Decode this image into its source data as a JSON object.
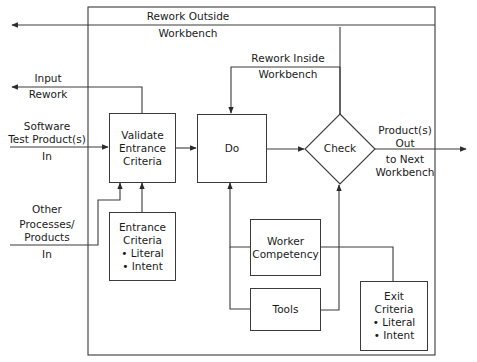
{
  "diagram": {
    "type": "workbench-process-flow",
    "nodes": {
      "validate": {
        "label": "Validate Entrance Criteria",
        "lines": [
          "Validate",
          "Entrance",
          "Criteria"
        ]
      },
      "do": {
        "label": "Do"
      },
      "check": {
        "label": "Check",
        "shape": "diamond"
      },
      "entrance_criteria": {
        "title_lines": [
          "Entrance",
          "Criteria"
        ],
        "bullets": [
          "• Literal",
          "• Intent"
        ]
      },
      "worker_competency": {
        "lines": [
          "Worker",
          "Competency"
        ]
      },
      "tools": {
        "label": "Tools"
      },
      "exit_criteria": {
        "title_lines": [
          "Exit",
          "Criteria"
        ],
        "bullets": [
          "• Literal",
          "• Intent"
        ]
      }
    },
    "edge_labels": {
      "rework_outside": [
        "Rework Outside",
        "Workbench"
      ],
      "rework_inside": [
        "Rework Inside",
        "Workbench"
      ],
      "input_rework": [
        "Input",
        "Rework"
      ],
      "software_in": [
        "Software",
        "Test Product(s)",
        "In"
      ],
      "other_in": [
        "Other",
        "Processes/",
        "Products",
        "In"
      ],
      "product_out": [
        "Product(s)",
        "Out",
        "to Next",
        "Workbench"
      ]
    },
    "edges": [
      {
        "from": "Software Test Product(s) In",
        "to": "Validate Entrance Criteria"
      },
      {
        "from": "Other Processes/Products In",
        "to": "Validate Entrance Criteria"
      },
      {
        "from": "Entrance Criteria",
        "to": "Validate Entrance Criteria"
      },
      {
        "from": "Validate Entrance Criteria",
        "to": "Do"
      },
      {
        "from": "Validate Entrance Criteria",
        "to": "Input Rework"
      },
      {
        "from": "Do",
        "to": "Check"
      },
      {
        "from": "Check",
        "to": "Do",
        "label": "Rework Inside Workbench"
      },
      {
        "from": "Check",
        "to": "outside",
        "label": "Rework Outside Workbench"
      },
      {
        "from": "Check",
        "to": "Product(s) Out to Next Workbench"
      },
      {
        "from": "Worker Competency",
        "to": "Do"
      },
      {
        "from": "Worker Competency",
        "to": "Check"
      },
      {
        "from": "Tools",
        "to": "Do"
      },
      {
        "from": "Tools",
        "to": "Check"
      },
      {
        "from": "Exit Criteria",
        "to": "Check"
      }
    ]
  }
}
